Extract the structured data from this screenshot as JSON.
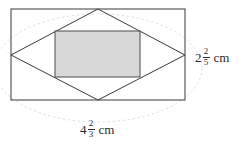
{
  "figure": {
    "type": "geometry-diagram",
    "background_color": "#ffffff",
    "stroke_color": "#3a3a3a",
    "shade_color": "#d8d8d8",
    "guide_color": "#d9d9d9",
    "outer_rectangle": {
      "name": "outer-rectangle",
      "x": 11,
      "y": 9,
      "width": 174,
      "height": 91
    },
    "rhombus": {
      "name": "inscribed-rhombus",
      "points": "98,9 185,55 98,100 11,55"
    },
    "shaded_rectangle": {
      "name": "shaded-rectangle",
      "x": 55,
      "y": 31,
      "width": 85,
      "height": 46,
      "fill": "#d8d8d8"
    },
    "guide_ellipse": {
      "name": "guide-ellipse",
      "cx": 98,
      "cy": 68,
      "rx": 104,
      "ry": 54
    }
  },
  "labels": {
    "height": {
      "whole": "2",
      "numerator": "2",
      "denominator": "5",
      "unit": "cm",
      "full_text": "2 2/5 cm"
    },
    "width": {
      "whole": "4",
      "numerator": "2",
      "denominator": "3",
      "unit": "cm",
      "full_text": "4 2/3 cm"
    }
  }
}
